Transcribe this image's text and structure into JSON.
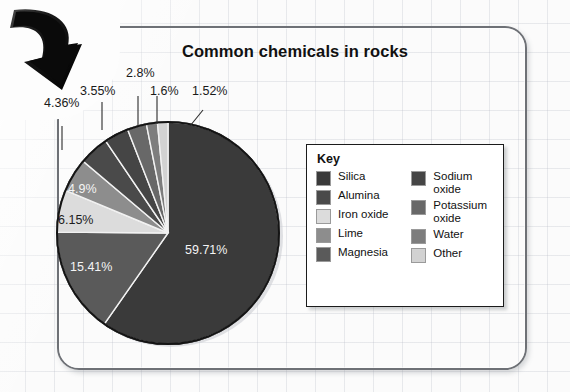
{
  "title": "Common chemicals in rocks",
  "key": {
    "heading": "Key",
    "left": [
      {
        "label": "Silica",
        "color": "#3a3a3a"
      },
      {
        "label": "Alumina",
        "color": "#4a4a4a"
      },
      {
        "label": "Iron oxide",
        "color": "#dcdcdc"
      },
      {
        "label": "Lime",
        "color": "#8d8d8d"
      },
      {
        "label": "Magnesia",
        "color": "#5a5a5a"
      }
    ],
    "right": [
      {
        "label": "Sodium\noxide",
        "color": "#454545"
      },
      {
        "label": "Potassium\noxide",
        "color": "#686868"
      },
      {
        "label": "Water",
        "color": "#7d7d7d"
      },
      {
        "label": "Other",
        "color": "#d2d2d2"
      }
    ]
  },
  "chart_data": {
    "type": "pie",
    "title": "Common chemicals in rocks",
    "unit": "%",
    "legend_position": "right",
    "categories": [
      "Silica",
      "Magnesia",
      "Iron oxide",
      "Lime",
      "Alumina",
      "Sodium oxide",
      "Potassium oxide",
      "Water",
      "Other"
    ],
    "slices": [
      {
        "name": "Silica",
        "value": 59.71,
        "label": "59.71%",
        "color": "#3a3a3a"
      },
      {
        "name": "Magnesia",
        "value": 15.41,
        "label": "15.41%",
        "color": "#5a5a5a"
      },
      {
        "name": "Iron oxide",
        "value": 6.15,
        "label": "6.15%",
        "color": "#dcdcdc"
      },
      {
        "name": "Lime",
        "value": 4.9,
        "label": "4.9%",
        "color": "#8d8d8d"
      },
      {
        "name": "Alumina",
        "value": 4.36,
        "label": "4.36%",
        "color": "#4a4a4a"
      },
      {
        "name": "Sodium oxide",
        "value": 3.55,
        "label": "3.55%",
        "color": "#454545"
      },
      {
        "name": "Potassium oxide",
        "value": 2.8,
        "label": "2.8%",
        "color": "#686868"
      },
      {
        "name": "Water",
        "value": 1.6,
        "label": "1.6%",
        "color": "#7d7d7d"
      },
      {
        "name": "Other",
        "value": 1.52,
        "label": "1.52%",
        "color": "#d2d2d2"
      }
    ],
    "values": [
      59.71,
      15.41,
      6.15,
      4.9,
      4.36,
      3.55,
      2.8,
      1.6,
      1.52
    ]
  },
  "labels": {
    "silica": "59.71%",
    "magnesia": "15.41%",
    "iron_oxide": "6.15%",
    "lime": "4.9%",
    "alumina": "4.36%",
    "sodium_oxide": "3.55%",
    "potassium_oxide": "2.8%",
    "water": "1.6%",
    "other": "1.52%"
  }
}
